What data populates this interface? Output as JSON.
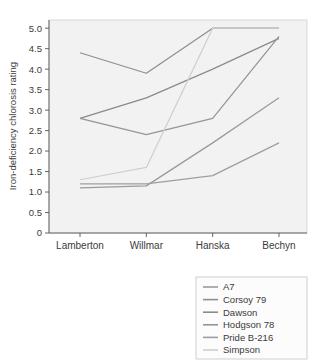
{
  "chart_data": {
    "type": "line",
    "title": "",
    "xlabel": "",
    "ylabel": "Iron-deficiency chlorosis rating",
    "categories": [
      "Lamberton",
      "Willmar",
      "Hanska",
      "Bechyn"
    ],
    "ylim": [
      0,
      5.2
    ],
    "yticks": [
      "0",
      "0.5",
      "1.0",
      "1.5",
      "2.0",
      "2.5",
      "3.0",
      "3.5",
      "4.0",
      "4.5",
      "5.0"
    ],
    "ytick_values": [
      0,
      0.5,
      1.0,
      1.5,
      2.0,
      2.5,
      3.0,
      3.5,
      4.0,
      4.5,
      5.0
    ],
    "grid": false,
    "legend_position": "bottom-right",
    "series": [
      {
        "name": "A7",
        "values": [
          1.1,
          1.15,
          2.2,
          3.3
        ],
        "color": "#9a9a9a"
      },
      {
        "name": "Corsoy 79",
        "values": [
          4.4,
          3.9,
          5.0,
          5.0
        ],
        "color": "#8f8f8f"
      },
      {
        "name": "Dawson",
        "values": [
          2.8,
          3.3,
          4.0,
          4.75
        ],
        "color": "#8a8a8a"
      },
      {
        "name": "Hodgson 78",
        "values": [
          2.8,
          2.4,
          2.8,
          4.8
        ],
        "color": "#959595"
      },
      {
        "name": "Pride B-216",
        "values": [
          1.2,
          1.2,
          1.4,
          2.2
        ],
        "color": "#9e9e9e"
      },
      {
        "name": "Simpson",
        "values": [
          1.3,
          1.6,
          5.0,
          5.0
        ],
        "color": "#cfcfcf"
      }
    ]
  },
  "legend": {
    "items": [
      {
        "label": "A7"
      },
      {
        "label": "Corsoy 79"
      },
      {
        "label": "Dawson"
      },
      {
        "label": "Hodgson 78"
      },
      {
        "label": "Pride B-216"
      },
      {
        "label": "Simpson"
      }
    ]
  }
}
